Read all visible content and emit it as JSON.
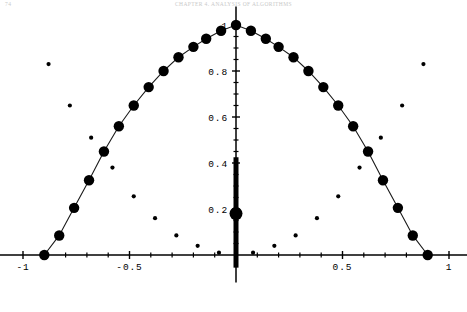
{
  "header": {
    "folio": "74",
    "running_title": "CHAPTER 4. ANALYSIS OF ALGORITHMS"
  },
  "plot": {
    "title": "",
    "axis_color": "#000000",
    "curve_color": "#1a1a1a",
    "marker_color": "#000000",
    "bar_color": "#000000"
  },
  "chart_data": {
    "type": "scatter",
    "title": "",
    "xlabel": "",
    "ylabel": "",
    "xlim": [
      -1.12,
      1.12
    ],
    "ylim": [
      -0.12,
      1.08
    ],
    "grid": false,
    "legend": null,
    "x_ticks_major": [
      -1,
      -0.5,
      0.5,
      1
    ],
    "x_tick_labels": [
      "-1",
      "-0.5",
      "0.5",
      "1"
    ],
    "x_ticks_minor": [
      -0.9,
      -0.8,
      -0.7,
      -0.6,
      -0.4,
      -0.3,
      -0.2,
      -0.1,
      0.1,
      0.2,
      0.3,
      0.4,
      0.6,
      0.7,
      0.8,
      0.9
    ],
    "y_ticks_major": [
      0.2,
      0.4,
      0.6,
      0.8,
      1.0
    ],
    "y_tick_labels": [
      "0.2",
      "0.4",
      "0.6",
      "0.8",
      "1"
    ],
    "y_ticks_minor": [
      0.05,
      0.1,
      0.15,
      0.25,
      0.3,
      0.35,
      0.45,
      0.5,
      0.55,
      0.65,
      0.7,
      0.75,
      0.85,
      0.9,
      0.95
    ],
    "series": [
      {
        "name": "semicircle-large-markers",
        "style": "line+marker",
        "marker": "filled-circle",
        "marker_size": 5.2,
        "x": [
          -0.9,
          -0.83,
          -0.76,
          -0.69,
          -0.62,
          -0.55,
          -0.48,
          -0.41,
          -0.34,
          -0.27,
          -0.2,
          -0.14,
          -0.07,
          0.0,
          0.07,
          0.14,
          0.2,
          0.27,
          0.34,
          0.41,
          0.48,
          0.55,
          0.62,
          0.69,
          0.76,
          0.83,
          0.9
        ],
        "values": [
          0.0,
          0.085,
          0.205,
          0.325,
          0.45,
          0.56,
          0.65,
          0.73,
          0.8,
          0.86,
          0.905,
          0.94,
          0.975,
          1.0,
          0.975,
          0.94,
          0.905,
          0.86,
          0.8,
          0.73,
          0.65,
          0.56,
          0.45,
          0.325,
          0.205,
          0.085,
          0.0
        ]
      },
      {
        "name": "v-shape-small-markers",
        "style": "marker-only",
        "marker": "filled-circle",
        "marker_size": 2.1,
        "x": [
          -0.88,
          -0.78,
          -0.68,
          -0.58,
          -0.48,
          -0.38,
          -0.28,
          -0.18,
          -0.08,
          0.08,
          0.18,
          0.28,
          0.38,
          0.48,
          0.58,
          0.68,
          0.78,
          0.88
        ],
        "values": [
          0.83,
          0.65,
          0.51,
          0.38,
          0.255,
          0.16,
          0.085,
          0.04,
          0.01,
          0.01,
          0.04,
          0.085,
          0.16,
          0.255,
          0.38,
          0.51,
          0.65,
          0.83
        ]
      },
      {
        "name": "vertical-bar-at-zero",
        "style": "thick-vertical-bar",
        "x": 0.0,
        "y_from": -0.055,
        "y_to": 0.425,
        "width_px": 5.0,
        "marker_at": 0.18,
        "marker_size": 6.5
      }
    ]
  }
}
